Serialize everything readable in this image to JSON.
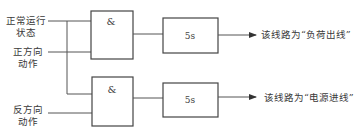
{
  "inputs": {
    "normal_run_state": {
      "line1": "正常运行",
      "line2": "状态"
    },
    "forward_action": {
      "line1": "正方向",
      "line2": "动作"
    },
    "reverse_action": {
      "line1": "反方向",
      "line2": "动作"
    }
  },
  "gates": [
    {
      "symbol": "&"
    },
    {
      "symbol": "&"
    }
  ],
  "delays": [
    {
      "label": "5s"
    },
    {
      "label": "5s"
    }
  ],
  "outputs": [
    {
      "text": "该线路为“负荷出线”"
    },
    {
      "text": "该线路为“电源进线”"
    }
  ],
  "colors": {
    "stroke": "#555555",
    "text": "#3a3a3a"
  }
}
